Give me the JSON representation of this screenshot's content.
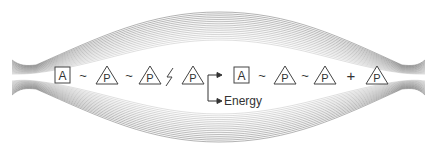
{
  "diagram": {
    "reactant": {
      "adenosine_label": "A",
      "phosphates": [
        "P",
        "P",
        "P"
      ],
      "bonds": [
        "~",
        "~",
        "lightning"
      ]
    },
    "products": {
      "adenosine_label": "A",
      "phosphates": [
        "P",
        "P"
      ],
      "bonds": [
        "~",
        "~"
      ],
      "plus": "+",
      "free_phosphate": "P"
    },
    "energy_label": "Energy",
    "colors": {
      "lines": "#555555",
      "text": "#333333",
      "background": "#ffffff"
    }
  }
}
